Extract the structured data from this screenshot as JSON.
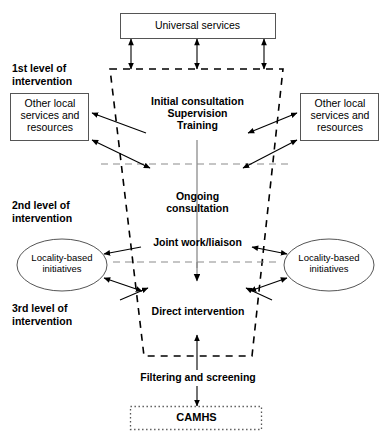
{
  "diagram": {
    "colors": {
      "stroke": "#000000",
      "grey_guide": "#8c8c8c",
      "box_border": "#555555",
      "text": "#000000",
      "background": "#ffffff"
    },
    "top_box": {
      "label": "Universal services",
      "border_style": "solid"
    },
    "level_labels": [
      {
        "id": "level-1",
        "label": "1st level of\nintervention"
      },
      {
        "id": "level-2",
        "label": "2nd level of\nintervention"
      },
      {
        "id": "level-3",
        "label": "3rd level of\nintervention"
      }
    ],
    "side_boxes": [
      {
        "id": "other-local-left",
        "label": "Other local\nservices and\nresources",
        "side": "left"
      },
      {
        "id": "other-local-right",
        "label": "Other local\nservices and\nresources",
        "side": "right"
      }
    ],
    "ellipses": [
      {
        "id": "locality-left",
        "label": "Locality-based\ninitiatives",
        "side": "left"
      },
      {
        "id": "locality-right",
        "label": "Locality-based\ninitiatives",
        "side": "right"
      }
    ],
    "funnel_stages": [
      {
        "id": "stage-initial",
        "label": "Initial consultation\nSupervision\nTraining"
      },
      {
        "id": "stage-ongoing",
        "label": "Ongoing\nconsultation"
      },
      {
        "id": "stage-joint",
        "label": "Joint work/liaison"
      },
      {
        "id": "stage-direct",
        "label": "Direct intervention"
      }
    ],
    "filter_label": "Filtering and screening",
    "bottom_box": {
      "label": "CAMHS",
      "border_style": "dotted"
    }
  }
}
